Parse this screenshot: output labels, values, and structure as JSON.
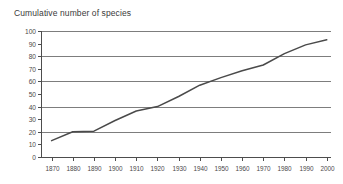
{
  "chart_data": {
    "type": "line",
    "title": "Cumulative number of species",
    "xlabel": "",
    "ylabel": "",
    "xlim": [
      1865,
      2002
    ],
    "ylim": [
      0,
      100
    ],
    "grid": true,
    "grid_values": [
      20,
      40,
      60,
      80,
      100
    ],
    "legend": null,
    "x": [
      1870,
      1880,
      1890,
      1900,
      1910,
      1920,
      1930,
      1940,
      1950,
      1960,
      1970,
      1980,
      1990,
      2000
    ],
    "values": [
      13,
      20,
      20.5,
      29,
      36.5,
      40,
      48,
      57,
      63,
      68.5,
      73,
      82,
      89,
      93
    ],
    "xticks": [
      "1870",
      "1880",
      "1890",
      "1900",
      "1910",
      "1920",
      "1930",
      "1940",
      "1950",
      "1960",
      "1970",
      "1980",
      "1990",
      "2000"
    ],
    "yticks": [
      "0",
      "10",
      "20",
      "30",
      "40",
      "50",
      "60",
      "70",
      "80",
      "90",
      "100"
    ],
    "ytick_values": [
      0,
      10,
      20,
      30,
      40,
      50,
      60,
      70,
      80,
      90,
      100
    ],
    "series_color": "#4a4a4a",
    "grid_color": "#7d7d7d",
    "axis_color": "#4d4d4d",
    "background_color": "#ffffff"
  }
}
